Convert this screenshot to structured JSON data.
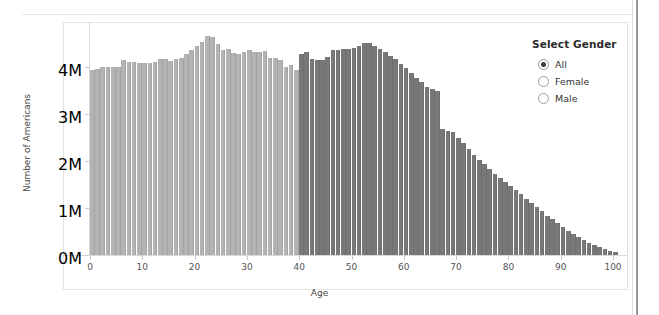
{
  "panel": {
    "legend": {
      "title": "Select Gender",
      "options": [
        {
          "label": "All",
          "selected": true
        },
        {
          "label": "Female",
          "selected": false
        },
        {
          "label": "Male",
          "selected": false
        }
      ]
    }
  },
  "colors": {
    "bar_light": "#b3b3b3",
    "bar_dark": "#787878",
    "bar_light_edge": "#a3a3a3",
    "bar_dark_edge": "#6e6e6e",
    "axis": "#d9d9d9",
    "text": "#555555",
    "card_border": "#e3e3e3"
  },
  "chart_data": {
    "type": "bar",
    "title": "",
    "xlabel": "Age",
    "ylabel": "Number of Americans",
    "xlim": [
      0,
      100
    ],
    "ylim": [
      0,
      5000000
    ],
    "grid": false,
    "legend_position": "right",
    "ytick_labels": [
      "0M",
      "1M",
      "2M",
      "3M",
      "4M"
    ],
    "ytick_values": [
      0,
      1000000,
      2000000,
      3000000,
      4000000
    ],
    "xtick_labels": [
      "0",
      "10",
      "20",
      "30",
      "40",
      "50",
      "60",
      "70",
      "80",
      "90",
      "100"
    ],
    "xtick_values": [
      0,
      10,
      20,
      30,
      40,
      50,
      60,
      70,
      80,
      90,
      100
    ],
    "series": [
      {
        "name": "Ages 0-39",
        "color": "#b3b3b3",
        "x": [
          0,
          1,
          2,
          3,
          4,
          5,
          6,
          7,
          8,
          9,
          10,
          11,
          12,
          13,
          14,
          15,
          16,
          17,
          18,
          19,
          20,
          21,
          22,
          23,
          24,
          25,
          26,
          27,
          28,
          29,
          30,
          31,
          32,
          33,
          34,
          35,
          36,
          37,
          38,
          39
        ],
        "values": [
          3940000,
          3960000,
          3990000,
          4000000,
          4000000,
          4010000,
          4150000,
          4110000,
          4110000,
          4090000,
          4090000,
          4080000,
          4100000,
          4180000,
          4160000,
          4130000,
          4160000,
          4190000,
          4280000,
          4370000,
          4450000,
          4540000,
          4650000,
          4640000,
          4490000,
          4370000,
          4380000,
          4290000,
          4280000,
          4330000,
          4370000,
          4310000,
          4310000,
          4350000,
          4200000,
          4190000,
          4150000,
          3990000,
          4050000,
          3930000
        ]
      },
      {
        "name": "Ages 40-100",
        "color": "#787878",
        "x": [
          40,
          41,
          42,
          43,
          44,
          45,
          46,
          47,
          48,
          49,
          50,
          51,
          52,
          53,
          54,
          55,
          56,
          57,
          58,
          59,
          60,
          61,
          62,
          63,
          64,
          65,
          66,
          67,
          68,
          69,
          70,
          71,
          72,
          73,
          74,
          75,
          76,
          77,
          78,
          79,
          80,
          81,
          82,
          83,
          84,
          85,
          86,
          87,
          88,
          89,
          90,
          91,
          92,
          93,
          94,
          95,
          96,
          97,
          98,
          99,
          100
        ],
        "values": [
          4270000,
          4320000,
          4160000,
          4140000,
          4150000,
          4220000,
          4370000,
          4370000,
          4380000,
          4390000,
          4410000,
          4440000,
          4510000,
          4520000,
          4440000,
          4380000,
          4330000,
          4230000,
          4160000,
          4060000,
          3970000,
          3870000,
          3760000,
          3680000,
          3580000,
          3530000,
          3480000,
          2680000,
          2640000,
          2610000,
          2500000,
          2390000,
          2250000,
          2130000,
          2020000,
          1930000,
          1830000,
          1730000,
          1640000,
          1560000,
          1470000,
          1380000,
          1290000,
          1200000,
          1110000,
          1020000,
          930000,
          840000,
          760000,
          680000,
          600000,
          520000,
          450000,
          380000,
          320000,
          260000,
          210000,
          165000,
          125000,
          95000,
          60000
        ]
      }
    ]
  }
}
